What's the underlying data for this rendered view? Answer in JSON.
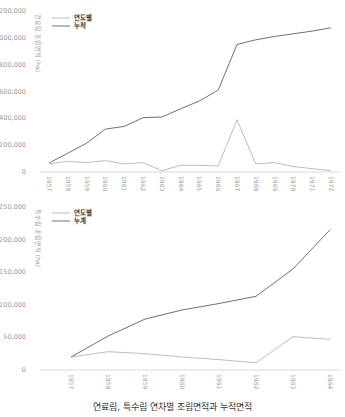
{
  "caption": "연료림, 특수림 연차별 조림면적과 누적면적",
  "chart_data": [
    {
      "type": "line",
      "title": "",
      "ylabel": "연료림 조림면적 (ha)",
      "xlabel": "",
      "x": [
        "1957",
        "1958",
        "1959",
        "1960",
        "1961",
        "1962",
        "1963",
        "1964",
        "1965",
        "1966",
        "1967",
        "1968",
        "1969",
        "1970",
        "1971",
        "1972"
      ],
      "ylim": [
        0,
        1200000
      ],
      "yticks": [
        "0",
        "200,000",
        "400,000",
        "600,000",
        "800,000",
        "1,000,000",
        "1,200,000"
      ],
      "legend_position": "top-left",
      "grid": false,
      "series": [
        {
          "name": "연도별",
          "color": "#bdbdbd",
          "values": [
            60000,
            80000,
            70000,
            85000,
            60000,
            70000,
            10000,
            50000,
            50000,
            45000,
            390000,
            60000,
            70000,
            40000,
            25000,
            10000
          ]
        },
        {
          "name": "누적",
          "color": "#707070",
          "values": [
            67000,
            140000,
            215000,
            320000,
            340000,
            405000,
            410000,
            470000,
            530000,
            610000,
            950000,
            985000,
            1010000,
            1030000,
            1050000,
            1075000
          ]
        }
      ]
    },
    {
      "type": "line",
      "title": "",
      "ylabel": "특수림 조림면적 (ha)",
      "xlabel": "",
      "x": [
        "1957",
        "1958",
        "1959",
        "1960",
        "1961",
        "1962",
        "1963",
        "1964"
      ],
      "ylim": [
        0,
        250000
      ],
      "yticks": [
        "0",
        "50,000",
        "100,000",
        "150,000",
        "200,000",
        "250,000"
      ],
      "legend_position": "top-left",
      "grid": false,
      "series": [
        {
          "name": "연도별",
          "color": "#bdbdbd",
          "values": [
            20000,
            28000,
            25000,
            20000,
            16000,
            11000,
            51000,
            47000
          ]
        },
        {
          "name": "누계",
          "color": "#707070",
          "values": [
            20000,
            52000,
            78000,
            92000,
            102000,
            113000,
            155000,
            215000
          ]
        }
      ]
    }
  ]
}
